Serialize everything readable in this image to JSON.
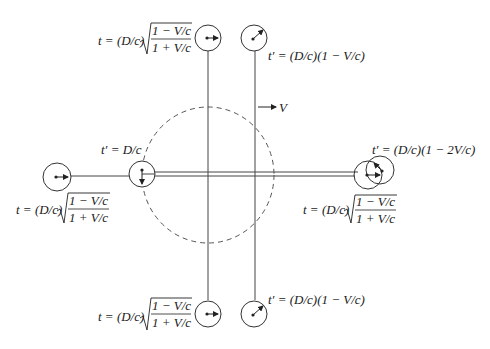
{
  "diagram": {
    "motion_label": "V",
    "labels": {
      "top_left": {
        "prefix": "t = (D/c)",
        "num": "1 − V/c",
        "den": "1 + V/c"
      },
      "top_right": {
        "text": "t′ = (D/c)(1 − V/c)"
      },
      "mid_left_upper": {
        "text": "t′ = D/c"
      },
      "mid_left_lower": {
        "prefix": "t = (D/c)",
        "num": "1 − V/c",
        "den": "1 + V/c"
      },
      "mid_right_upper": {
        "text": "t′ = (D/c)(1 − 2V/c)"
      },
      "mid_right_lower": {
        "prefix": "t = (D/c)",
        "num": "1 − V/c",
        "den": "1 + V/c"
      },
      "bottom_left": {
        "prefix": "t = (D/c)",
        "num": "1 − V/c",
        "den": "1 + V/c"
      },
      "bottom_right": {
        "text": "t′ = (D/c)(1 − V/c)"
      }
    },
    "colors": {
      "stroke": "#333333",
      "text": "#1a1a1a"
    }
  }
}
